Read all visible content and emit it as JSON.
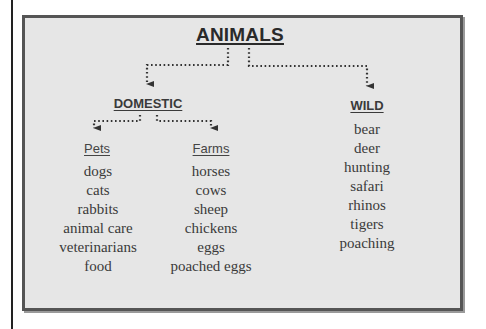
{
  "diagram": {
    "root": {
      "label": "ANIMALS"
    },
    "categories": [
      {
        "id": "domestic",
        "label": "DOMESTIC",
        "subcategories": [
          {
            "id": "pets",
            "label": "Pets",
            "items": [
              "dogs",
              "cats",
              "rabbits",
              "animal care",
              "veterinarians",
              "food"
            ]
          },
          {
            "id": "farms",
            "label": "Farms",
            "items": [
              "horses",
              "cows",
              "sheep",
              "chickens",
              "eggs",
              "poached eggs"
            ]
          }
        ]
      },
      {
        "id": "wild",
        "label": "WILD",
        "items": [
          "bear",
          "deer",
          "hunting",
          "safari",
          "rhinos",
          "tigers",
          "poaching"
        ]
      }
    ]
  },
  "colors": {
    "panel_fill": "#e6e6e6",
    "panel_border": "#555555",
    "text": "#333333",
    "connector": "#333333"
  }
}
